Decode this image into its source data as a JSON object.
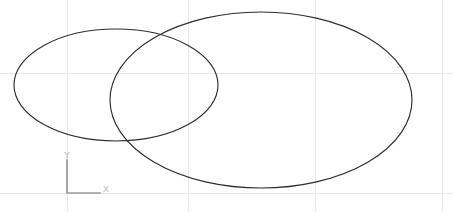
{
  "app": {
    "name": "CAD Drawing Viewport",
    "background_color": "#ffffff",
    "width": 453,
    "height": 212
  },
  "ghost_text": {
    "clipped_toolbar_text": ""
  },
  "grid": {
    "visible": true,
    "color": "#e8e8ea",
    "vertical_x": [
      67,
      188,
      315,
      442
    ],
    "horizontal_y": [
      73,
      193
    ]
  },
  "ucs_icon": {
    "name": "UCS Icon",
    "color": "#9a9a9e",
    "origin_x": 67,
    "origin_y": 193,
    "y_arm_top": 160,
    "x_arm_right": 100,
    "x_label": "X",
    "y_label": "Y",
    "x_label_pos": [
      103,
      192
    ],
    "y_label_pos": [
      64,
      158
    ],
    "label_color": "#b9b9bd"
  },
  "entities": {
    "stroke_color": "#2e2e2e",
    "stroke_width": 1.15,
    "items": [
      {
        "id": "ellipse-small",
        "type": "ellipse",
        "label": "Small Ellipse",
        "cx": 116,
        "cy": 85,
        "rx": 102,
        "ry": 56,
        "bounds": {
          "left": 14,
          "right": 218,
          "top": 29,
          "bottom": 141
        }
      },
      {
        "id": "ellipse-large",
        "type": "ellipse",
        "label": "Large Ellipse",
        "cx": 261,
        "cy": 100,
        "rx": 151,
        "ry": 88,
        "bounds": {
          "left": 110,
          "right": 412,
          "top": 12,
          "bottom": 188
        }
      }
    ]
  }
}
